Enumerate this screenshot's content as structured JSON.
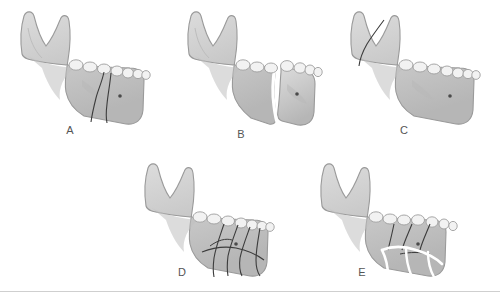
{
  "figure": {
    "background_color": "#ffffff",
    "divider_color": "#cfcfcf",
    "bone_fill": "#c9c9c9",
    "bone_shade": "#b4b4b4",
    "bone_highlight": "#dcdcdc",
    "bone_outline": "#9a9a9a",
    "tooth_fill": "#f2f2f2",
    "tooth_outline": "#9e9e9e",
    "fracture_line_color": "#3c3c3c",
    "displaced_gap_color": "#ffffff",
    "label_color": "#555555"
  },
  "panels": [
    {
      "id": "A",
      "label": "A",
      "view": "lateral right hemimandible",
      "description": "Simple non-displaced fracture through the body of the mandible",
      "fracture_type": "simple",
      "displaced": false,
      "fracture_line_count": 2,
      "region": "body",
      "landmark": "mental foramen"
    },
    {
      "id": "B",
      "label": "B",
      "view": "lateral right hemimandible",
      "description": "Displaced fracture of the mandibular body with separation of fragments",
      "fracture_type": "simple",
      "displaced": true,
      "fracture_line_count": 1,
      "region": "body",
      "landmark": "mental foramen"
    },
    {
      "id": "C",
      "label": "C",
      "view": "lateral right hemimandible",
      "description": "Non-displaced fracture through the ramus and coronoid region",
      "fracture_type": "simple",
      "displaced": false,
      "fracture_line_count": 1,
      "region": "ramus",
      "landmark": "mental foramen"
    },
    {
      "id": "D",
      "label": "D",
      "view": "lateral right hemimandible",
      "description": "Comminuted non-displaced fracture of the anterior body with multiple fragments",
      "fracture_type": "comminuted",
      "displaced": false,
      "fracture_line_count": 6,
      "region": "body / parasymphysis",
      "landmark": "mental foramen"
    },
    {
      "id": "E",
      "label": "E",
      "view": "lateral right hemimandible",
      "description": "Comminuted displaced fracture of the anterior body with separated fragments",
      "fracture_type": "comminuted",
      "displaced": true,
      "fracture_line_count": 7,
      "region": "body / parasymphysis",
      "landmark": "mental foramen"
    }
  ],
  "labels": {
    "a": "A",
    "b": "B",
    "c": "C",
    "d": "D",
    "e": "E"
  }
}
